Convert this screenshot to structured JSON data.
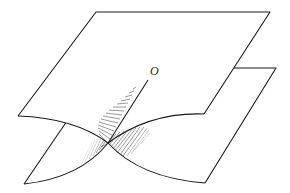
{
  "figure": {
    "type": "surface-diagram",
    "labels": {
      "origin": "O"
    },
    "colors": {
      "line": "#1a1a1a",
      "background": "#ffffff",
      "shading": "#333333"
    }
  }
}
